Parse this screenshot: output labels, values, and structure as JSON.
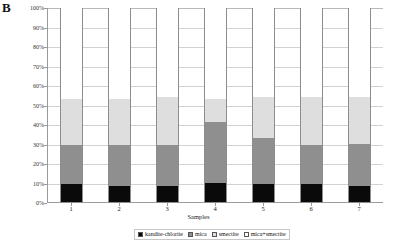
{
  "panel": {
    "label": "B"
  },
  "chart_data": {
    "type": "bar",
    "subtype": "stacked-percent",
    "title": "",
    "xlabel": "Samples",
    "ylabel": "",
    "categories": [
      "1",
      "2",
      "3",
      "4",
      "5",
      "6",
      "7"
    ],
    "ylim": [
      0,
      100
    ],
    "ytick_labels": [
      "0%",
      "10%",
      "20%",
      "30%",
      "40%",
      "50%",
      "60%",
      "70%",
      "80%",
      "90%",
      "100%"
    ],
    "ytick_values": [
      0,
      10,
      20,
      30,
      40,
      50,
      60,
      70,
      80,
      90,
      100
    ],
    "grid": true,
    "legend_position": "bottom",
    "series": [
      {
        "name": "kandite-chlorite",
        "color": "#0a0a0a",
        "values": [
          9,
          8,
          8,
          10,
          9,
          9,
          8
        ]
      },
      {
        "name": "mica",
        "color": "#8f8f8f",
        "values": [
          20,
          21,
          21,
          31,
          24,
          20,
          22
        ]
      },
      {
        "name": "smectite",
        "color": "#dedede",
        "values": [
          24,
          24,
          25,
          12,
          21,
          25,
          24
        ]
      },
      {
        "name": "mica+smectite",
        "color": "#ffffff",
        "values": [
          47,
          47,
          46,
          47,
          46,
          46,
          46
        ]
      }
    ]
  },
  "legend": {
    "items": [
      {
        "label": "kandite-chlorite",
        "swatch": "k"
      },
      {
        "label": "mica",
        "swatch": "m"
      },
      {
        "label": "smectite",
        "swatch": "s"
      },
      {
        "label": "mica+smectite",
        "swatch": "ms"
      }
    ]
  }
}
